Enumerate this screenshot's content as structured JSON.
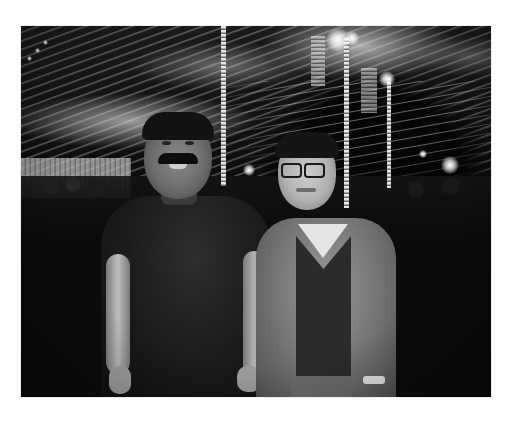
{
  "image": {
    "description": "Black-and-white photograph of two men standing under a decorated wedding/event tent at night",
    "border_color": "#ffffff",
    "photo_bounds": {
      "x": 21,
      "y": 26,
      "width": 470,
      "height": 371
    },
    "palette": {
      "background": "#0b0b0b",
      "highlight": "#e6e6e6",
      "midtone": "#7a7a7a"
    },
    "subjects": [
      {
        "id": "man-left",
        "features": [
          "mustache",
          "dark shirt",
          "smiling"
        ]
      },
      {
        "id": "man-right",
        "features": [
          "glasses",
          "light jacket",
          "dark v-neck sweater",
          "white collar shirt"
        ]
      }
    ],
    "scene_elements": [
      "draped tent ceiling",
      "strings of lights",
      "pole lights",
      "chandelier",
      "crowd in background"
    ]
  }
}
